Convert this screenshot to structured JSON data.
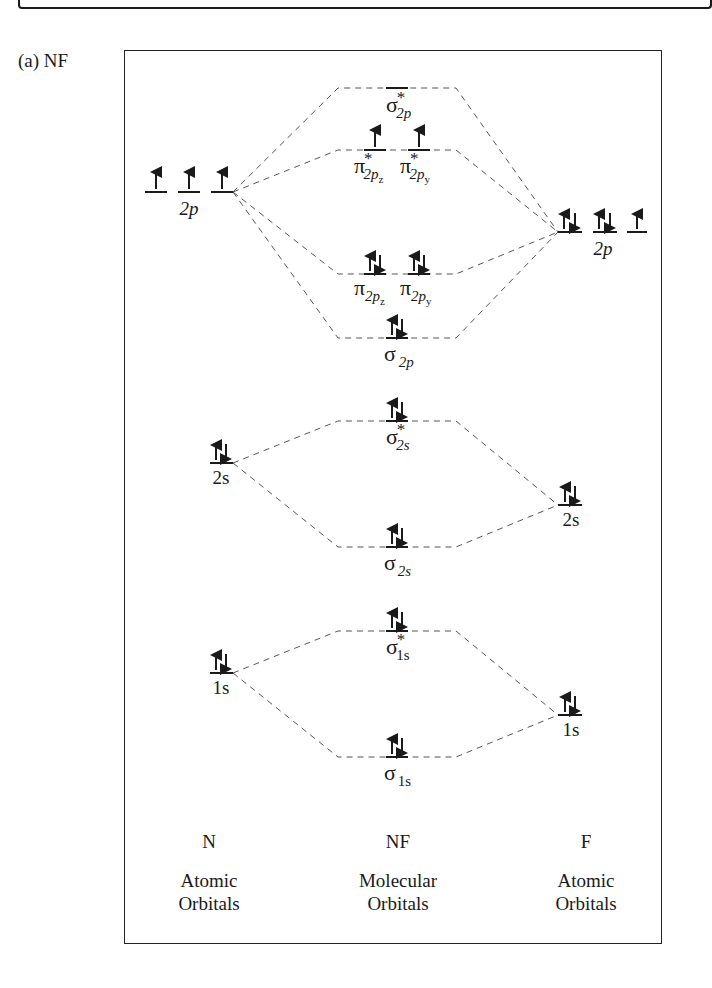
{
  "figure": {
    "part_label": "(a)  NF",
    "molecule": "NF"
  },
  "columns": {
    "left": {
      "atom": "N",
      "caption_line1": "Atomic",
      "caption_line2": "Orbitals"
    },
    "center": {
      "atom": "NF",
      "caption_line1": "Molecular",
      "caption_line2": "Orbitals"
    },
    "right": {
      "atom": "F",
      "caption_line1": "Atomic",
      "caption_line2": "Orbitals"
    }
  },
  "atomic_orbitals": {
    "N": [
      {
        "label": "2p",
        "y": 192,
        "boxes": [
          "up",
          "up",
          "up"
        ]
      },
      {
        "label": "2s",
        "y": 463,
        "boxes": [
          "pair"
        ]
      },
      {
        "label": "1s",
        "y": 673,
        "boxes": [
          "pair"
        ]
      }
    ],
    "F": [
      {
        "label": "2p",
        "y": 232,
        "boxes": [
          "pair",
          "pair",
          "up"
        ]
      },
      {
        "label": "2s",
        "y": 505,
        "boxes": [
          "pair"
        ]
      },
      {
        "label": "1s",
        "y": 715,
        "boxes": [
          "pair"
        ]
      }
    ]
  },
  "molecular_orbitals": [
    {
      "name": "sigma*2p",
      "symbol": "σ",
      "star": true,
      "sub": "2p",
      "y": 88,
      "boxes": [
        "empty"
      ]
    },
    {
      "name": "pi*2p",
      "symbol": "π",
      "star": true,
      "subs": [
        "2pz",
        "2py"
      ],
      "y": 150,
      "boxes": [
        "up",
        "up"
      ]
    },
    {
      "name": "pi2p",
      "symbol": "π",
      "star": false,
      "subs": [
        "2pz",
        "2py"
      ],
      "y": 274,
      "boxes": [
        "pair",
        "pair"
      ]
    },
    {
      "name": "sigma2p",
      "symbol": "σ",
      "star": false,
      "sub": "2p",
      "y": 338,
      "boxes": [
        "pair"
      ]
    },
    {
      "name": "sigma*2s",
      "symbol": "σ",
      "star": true,
      "sub": "2s",
      "y": 421,
      "boxes": [
        "pair"
      ]
    },
    {
      "name": "sigma2s",
      "symbol": "σ",
      "star": false,
      "sub": "2s",
      "y": 547,
      "boxes": [
        "pair"
      ]
    },
    {
      "name": "sigma*1s",
      "symbol": "σ",
      "star": true,
      "sub": "1s",
      "y": 631,
      "boxes": [
        "pair"
      ]
    },
    {
      "name": "sigma1s",
      "symbol": "σ",
      "star": false,
      "sub": "1s",
      "y": 757,
      "boxes": [
        "pair"
      ]
    }
  ],
  "labels": {
    "n2p": "2p",
    "n2s": "2s",
    "n1s": "1s",
    "f2p": "2p",
    "f2s": "2s",
    "f1s": "1s",
    "sigma": "σ",
    "pi": "π",
    "star": "*",
    "sub_2p": "2p",
    "sub_2s": "2s",
    "sub_1s": "1s",
    "sub_2pz_main": "2p",
    "sub_z": "z",
    "sub_y": "y"
  },
  "colors": {
    "ink": "#1a1a1a",
    "dash": "#555555",
    "background": "#ffffff"
  }
}
